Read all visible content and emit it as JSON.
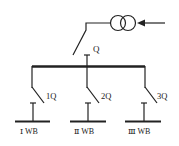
{
  "diagram": {
    "type": "single-line electrical diagram",
    "colors": {
      "line": "#222222",
      "background": "#ffffff"
    },
    "source": {
      "symbol": "transformer-icon",
      "input_arrow": "arrow-left-icon"
    },
    "main_switch": {
      "label": "Q"
    },
    "main_busbar": {},
    "feeders": [
      {
        "switch_label": "1Q",
        "bus_label": "Ⅰ WB"
      },
      {
        "switch_label": "2Q",
        "bus_label": "Ⅱ WB"
      },
      {
        "switch_label": "3Q",
        "bus_label": "Ⅲ WB"
      }
    ]
  }
}
